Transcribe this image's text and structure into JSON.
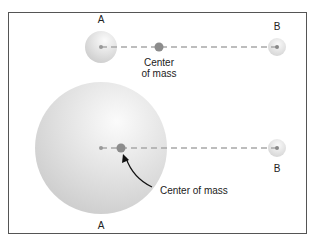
{
  "top_system": {
    "label_a": "A",
    "label_b": "B",
    "center_label_line1": "Center",
    "center_label_line2": "of mass"
  },
  "bottom_system": {
    "label_a": "A",
    "label_b": "B",
    "center_label": "Center of mass"
  },
  "colors": {
    "frame": "#555555",
    "sphere": "#d8d8d8",
    "dash_line": "#a8a8a8",
    "center_dot": "#8c8c8c",
    "arrow": "#111111"
  }
}
